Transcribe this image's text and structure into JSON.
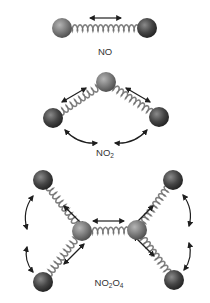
{
  "colors": {
    "nitrogen": "#7a7a7a",
    "oxygen": "#3e3e3e",
    "spring": "#9a9a9a",
    "arrow": "#1e1e1e",
    "label": "#333333"
  },
  "molecules": [
    {
      "id": "NO",
      "label_parts": [
        "NO"
      ],
      "atoms": [
        {
          "element": "N",
          "x": 62,
          "y": 28
        },
        {
          "element": "O",
          "x": 147,
          "y": 28
        }
      ],
      "bonds": [
        [
          0,
          1
        ]
      ],
      "vibration_arrows": [
        {
          "type": "straight",
          "from": [
            90,
            18
          ],
          "to": [
            121,
            18
          ],
          "double": true
        }
      ]
    },
    {
      "id": "NO2",
      "label_parts": [
        "NO",
        "2"
      ],
      "atoms": [
        {
          "element": "N",
          "x": 106,
          "y": 82
        },
        {
          "element": "O",
          "x": 53,
          "y": 118
        },
        {
          "element": "O",
          "x": 159,
          "y": 117
        }
      ],
      "bonds": [
        [
          0,
          1
        ],
        [
          0,
          2
        ]
      ],
      "vibration_arrows": [
        {
          "type": "straight",
          "from": [
            62,
            102
          ],
          "to": [
            86,
            88
          ],
          "double": true
        },
        {
          "type": "straight",
          "from": [
            126,
            88
          ],
          "to": [
            150,
            102
          ],
          "double": true
        },
        {
          "type": "curved",
          "from": [
            65,
            130
          ],
          "to": [
            97,
            143
          ],
          "double": true
        },
        {
          "type": "curved",
          "from": [
            147,
            130
          ],
          "to": [
            115,
            143
          ],
          "double": true
        }
      ]
    },
    {
      "id": "N2O4",
      "label_parts": [
        "NO",
        "2",
        "O",
        "4"
      ],
      "atoms": [
        {
          "element": "N",
          "x": 82,
          "y": 231
        },
        {
          "element": "N",
          "x": 137,
          "y": 230
        },
        {
          "element": "O",
          "x": 43,
          "y": 180
        },
        {
          "element": "O",
          "x": 43,
          "y": 282
        },
        {
          "element": "O",
          "x": 173,
          "y": 180
        },
        {
          "element": "O",
          "x": 174,
          "y": 280
        }
      ],
      "bonds": [
        [
          0,
          1
        ],
        [
          0,
          2
        ],
        [
          0,
          3
        ],
        [
          1,
          4
        ],
        [
          1,
          5
        ]
      ],
      "vibration_arrows": [
        {
          "type": "straight",
          "from": [
            93,
            221
          ],
          "to": [
            124,
            221
          ],
          "double": true
        },
        {
          "type": "straight",
          "from": [
            64,
            206
          ],
          "to": [
            84,
            226
          ],
          "double": true
        },
        {
          "type": "straight",
          "from": [
            64,
            264
          ],
          "to": [
            84,
            244
          ],
          "double": true
        },
        {
          "type": "straight",
          "from": [
            153,
            206
          ],
          "to": [
            133,
            226
          ],
          "double": true
        },
        {
          "type": "straight",
          "from": [
            154,
            256
          ],
          "to": [
            134,
            236
          ],
          "double": true
        },
        {
          "type": "curved",
          "from": [
            33,
            196
          ],
          "to": [
            27,
            229
          ],
          "double": true
        },
        {
          "type": "curved",
          "from": [
            27,
            247
          ],
          "to": [
            33,
            272
          ],
          "double": true
        },
        {
          "type": "curved",
          "from": [
            183,
            195
          ],
          "to": [
            189,
            226
          ],
          "double": true
        },
        {
          "type": "curved",
          "from": [
            189,
            243
          ],
          "to": [
            184,
            270
          ],
          "double": true
        }
      ]
    }
  ],
  "labels": {
    "no": {
      "main": "NO"
    },
    "no2": {
      "main": "NO",
      "sub": "2"
    },
    "n2o4": {
      "part1": "NO",
      "sub1": "2",
      "part2": "O",
      "sub2": "4"
    }
  }
}
